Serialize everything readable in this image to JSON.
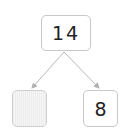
{
  "diagram": {
    "type": "number-bond",
    "whole": "14",
    "parts": [
      {
        "value": "",
        "state": "blank-shaded"
      },
      {
        "value": "8"
      }
    ],
    "colors": {
      "border": "#c8c8c8",
      "arrow": "#b0b0b0",
      "blank_fill": "#f0f0f0"
    }
  }
}
